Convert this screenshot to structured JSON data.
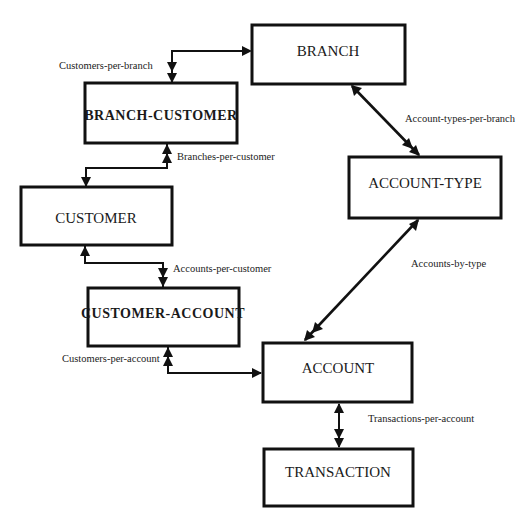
{
  "diagram": {
    "type": "entity-relationship",
    "entities": {
      "branch": "BRANCH",
      "branch_customer": "BRANCH-CUSTOMER",
      "customer": "CUSTOMER",
      "account_type": "ACCOUNT-TYPE",
      "customer_account": "CUSTOMER-ACCOUNT",
      "account": "ACCOUNT",
      "transaction": "TRANSACTION"
    },
    "relationships": {
      "customers_per_branch": "Customers-per-branch",
      "branches_per_customer": "Branches-per-customer",
      "account_types_per_branch": "Account-types-per-branch",
      "accounts_per_customer": "Accounts-per-customer",
      "accounts_by_type": "Accounts-by-type",
      "customers_per_account": "Customers-per-account",
      "transactions_per_account": "Transactions-per-account"
    },
    "connections": [
      {
        "from": "BRANCH",
        "to": "BRANCH-CUSTOMER",
        "label": "Customers-per-branch",
        "from_end": "single",
        "to_end": "double"
      },
      {
        "from": "CUSTOMER",
        "to": "BRANCH-CUSTOMER",
        "label": "Branches-per-customer",
        "from_end": "single",
        "to_end": "double"
      },
      {
        "from": "BRANCH",
        "to": "ACCOUNT-TYPE",
        "label": "Account-types-per-branch",
        "from_end": "single",
        "to_end": "double"
      },
      {
        "from": "CUSTOMER",
        "to": "CUSTOMER-ACCOUNT",
        "label": "Accounts-per-customer",
        "from_end": "single",
        "to_end": "double"
      },
      {
        "from": "ACCOUNT-TYPE",
        "to": "ACCOUNT",
        "label": "Accounts-by-type",
        "from_end": "single",
        "to_end": "double"
      },
      {
        "from": "ACCOUNT",
        "to": "CUSTOMER-ACCOUNT",
        "label": "Customers-per-account",
        "from_end": "single",
        "to_end": "double"
      },
      {
        "from": "ACCOUNT",
        "to": "TRANSACTION",
        "label": "Transactions-per-account",
        "from_end": "single",
        "to_end": "double"
      }
    ]
  }
}
